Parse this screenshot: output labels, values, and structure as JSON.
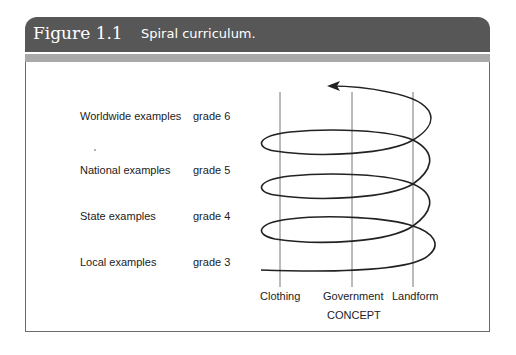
{
  "figure": {
    "number": "Figure 1.1",
    "caption": "Spiral curriculum.",
    "header_color": "#575757",
    "band_color": "#a9a9a9"
  },
  "rows": [
    {
      "label": "Worldwide examples",
      "grade": "grade 6"
    },
    {
      "label": "National examples",
      "grade": "grade 5"
    },
    {
      "label": "State examples",
      "grade": "grade 4"
    },
    {
      "label": "Local examples",
      "grade": "grade 3"
    }
  ],
  "concepts": [
    "Clothing",
    "Government",
    "Landform"
  ],
  "axis_title": "CONCEPT"
}
